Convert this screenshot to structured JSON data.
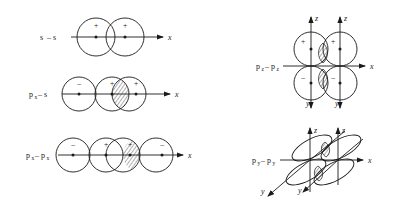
{
  "figure": {
    "background_color": "#ffffff",
    "stroke_color": "#1a1a1a",
    "width": 399,
    "height": 207,
    "panels": [
      {
        "id": "s-s",
        "label_main": "s",
        "label_dash": "–",
        "label_main2": "s",
        "label_sub": "",
        "label_sub2": "",
        "axis_x_label": "x",
        "lobe_signs": [
          "+",
          "+"
        ],
        "lobe_count": 2,
        "overlap_hatched": false,
        "axes": [
          "x"
        ]
      },
      {
        "id": "px-s",
        "label_main": "p",
        "label_sub": "x",
        "label_dash": "–",
        "label_main2": "s",
        "label_sub2": "",
        "axis_x_label": "x",
        "lobe_signs": [
          "–",
          "+",
          "+"
        ],
        "lobe_count": 3,
        "overlap_hatched": true,
        "axes": [
          "x"
        ]
      },
      {
        "id": "px-px",
        "label_main": "p",
        "label_sub": "x",
        "label_dash": "–",
        "label_main2": "p",
        "label_sub2": "x",
        "axis_x_label": "x",
        "lobe_signs": [
          "–",
          "+",
          "+",
          "–"
        ],
        "lobe_count": 4,
        "overlap_hatched": true,
        "axes": [
          "x"
        ]
      },
      {
        "id": "pz-pz",
        "label_main": "p",
        "label_sub": "z",
        "label_dash": "–",
        "label_main2": "p",
        "label_sub2": "z",
        "axis_x_label": "x",
        "axis_z_label_left": "z",
        "axis_z_label_right": "z",
        "axis_y_label_left": "y",
        "axis_y_label_right": "y",
        "lobe_signs": [
          "+",
          "+",
          "–",
          "–"
        ],
        "lobe_count": 4,
        "overlap_hatched": true,
        "axes": [
          "x",
          "z",
          "z",
          "y",
          "y"
        ]
      },
      {
        "id": "py-py",
        "label_main": "p",
        "label_sub": "y",
        "label_dash": "–",
        "label_main2": "p",
        "label_sub2": "y",
        "axis_x_label": "x",
        "axis_z_label_left": "z",
        "axis_z_label_right": "z",
        "axis_y_label_left": "y",
        "axis_y_label_right": "y",
        "lobe_signs": [],
        "lobe_count": 4,
        "overlap_hatched": true,
        "axes": [
          "x",
          "z",
          "z",
          "y",
          "y"
        ]
      }
    ]
  }
}
